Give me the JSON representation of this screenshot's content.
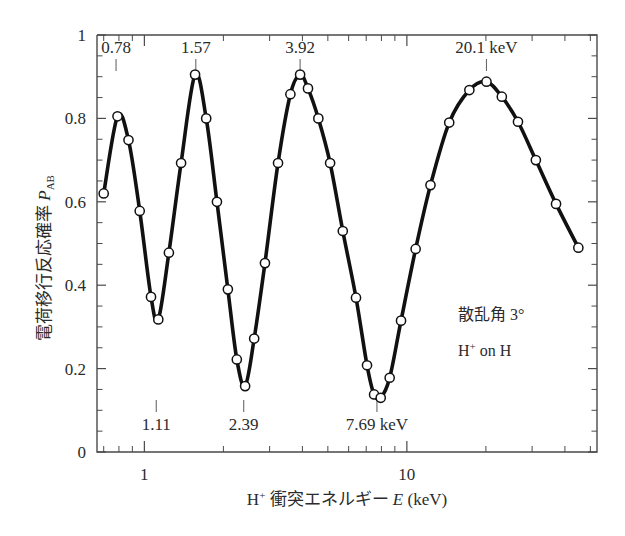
{
  "figure": {
    "background_color": "#ffffff",
    "curve_color": "#111111",
    "marker_fill": "#ffffff",
    "axis_color": "#4a4a4a"
  },
  "axes": {
    "y": {
      "label_main": "電荷移行反応確率",
      "label_symbol": "P",
      "label_subscript": "AB",
      "ticks": [
        "0",
        "0.2",
        "0.4",
        "0.6",
        "0.8",
        "1"
      ],
      "tick_values": [
        0,
        0.2,
        0.4,
        0.6,
        0.8,
        1
      ],
      "minor_step": 0.05,
      "range": [
        0,
        1
      ]
    },
    "x": {
      "label_prefix": "H",
      "label_prefix_sup": "+",
      "label_main": "衝突エネルギー",
      "label_symbol": "E",
      "label_unit": "(keV)",
      "ticks": [
        "1",
        "10"
      ],
      "tick_values": [
        1,
        10
      ],
      "scale": "log",
      "range": [
        0.66,
        53
      ]
    }
  },
  "annotations": {
    "top": [
      {
        "text": "0.78",
        "value": 0.78
      },
      {
        "text": "1.57",
        "value": 1.57
      },
      {
        "text": "3.92",
        "value": 3.92
      },
      {
        "text": "20.1 keV",
        "value": 20.1
      }
    ],
    "bottom": [
      {
        "text": "1.11",
        "value": 1.11
      },
      {
        "text": "2.39",
        "value": 2.39
      },
      {
        "text": "7.69 keV",
        "value": 7.69
      }
    ],
    "notes": [
      {
        "text": "散乱角 3°"
      },
      {
        "text": "H",
        "sup": "+",
        "rest": " on H"
      }
    ]
  },
  "chart_data": {
    "type": "line",
    "title": "",
    "xlabel": "H+ 衝突エネルギー E (keV)",
    "ylabel": "電荷移行反応確率 P_AB",
    "xscale": "log",
    "xlim": [
      0.66,
      53
    ],
    "ylim": [
      0,
      1
    ],
    "grid": false,
    "legend": null,
    "marker": "open-circle",
    "series": [
      {
        "name": "P_AB",
        "points": [
          [
            0.7,
            0.62
          ],
          [
            0.79,
            0.805
          ],
          [
            0.87,
            0.748
          ],
          [
            0.96,
            0.578
          ],
          [
            1.06,
            0.372
          ],
          [
            1.13,
            0.318
          ],
          [
            1.24,
            0.478
          ],
          [
            1.38,
            0.693
          ],
          [
            1.56,
            0.905
          ],
          [
            1.72,
            0.8
          ],
          [
            1.89,
            0.6
          ],
          [
            2.08,
            0.39
          ],
          [
            2.25,
            0.222
          ],
          [
            2.42,
            0.158
          ],
          [
            2.62,
            0.272
          ],
          [
            2.88,
            0.453
          ],
          [
            3.23,
            0.693
          ],
          [
            3.6,
            0.858
          ],
          [
            3.92,
            0.905
          ],
          [
            4.2,
            0.872
          ],
          [
            4.6,
            0.8
          ],
          [
            5.1,
            0.693
          ],
          [
            5.7,
            0.53
          ],
          [
            6.4,
            0.37
          ],
          [
            7.05,
            0.208
          ],
          [
            7.5,
            0.138
          ],
          [
            7.95,
            0.13
          ],
          [
            8.6,
            0.178
          ],
          [
            9.5,
            0.315
          ],
          [
            10.8,
            0.487
          ],
          [
            12.3,
            0.64
          ],
          [
            14.5,
            0.79
          ],
          [
            17.3,
            0.868
          ],
          [
            20.1,
            0.888
          ],
          [
            23.0,
            0.852
          ],
          [
            26.5,
            0.792
          ],
          [
            31.0,
            0.7
          ],
          [
            37.0,
            0.595
          ],
          [
            45.0,
            0.49
          ]
        ]
      }
    ]
  }
}
